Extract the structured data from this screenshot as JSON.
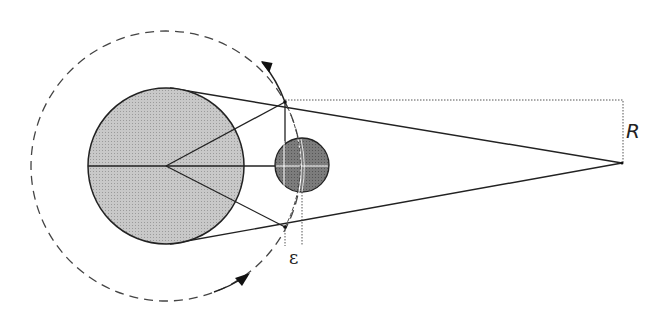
{
  "diagram": {
    "labels": {
      "radius": "R",
      "epsilon": "ε"
    },
    "colors": {
      "large_body_fill": "#c4c4c4",
      "small_body_fill": "#7a7a7a",
      "line": "#222222",
      "background": "#ffffff"
    },
    "elements": {
      "large_body": {
        "cx": 166,
        "cy": 166,
        "r": 78
      },
      "orbit": {
        "cx": 166,
        "cy": 166,
        "r": 135,
        "style": "dashed"
      },
      "small_body": {
        "cx": 302,
        "cy": 165,
        "r": 27
      },
      "apex": {
        "x": 622,
        "y": 163
      },
      "tangent_point_top": {
        "x": 285,
        "y": 102
      },
      "tangent_point_bottom": {
        "x": 285,
        "y": 227
      }
    }
  }
}
